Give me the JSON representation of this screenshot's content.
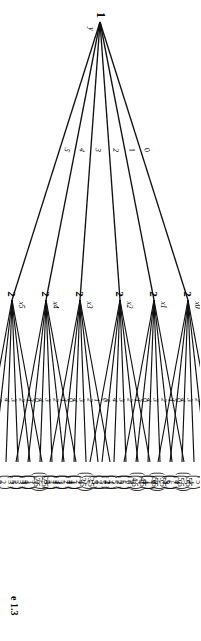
{
  "figure": {
    "caption": "e 1.3",
    "root": {
      "player": "1",
      "name": "y"
    },
    "root_actions": [
      "0",
      "1",
      "2",
      "3",
      "4",
      "5"
    ],
    "subnode_actions": [
      "0",
      "1",
      "2",
      "3",
      "4",
      "5"
    ],
    "nodes": [
      {
        "name": "x0",
        "player": "2",
        "payoffs": [
          [
            "5",
            "6"
          ],
          [
            "5",
            "5"
          ],
          [
            "5",
            "4"
          ],
          [
            "5",
            "3"
          ],
          [
            "7",
            "5"
          ],
          [
            "5.5",
            "5.5"
          ]
        ]
      },
      {
        "name": "x1",
        "player": "2",
        "payoffs": [
          [
            "5.5",
            "5.5"
          ],
          [
            "4",
            "6"
          ],
          [
            "4",
            "5"
          ],
          [
            "4",
            "4"
          ],
          [
            "4",
            "3"
          ],
          [
            "6",
            "5"
          ]
        ]
      },
      {
        "name": "x2",
        "player": "2",
        "payoffs": [
          [
            "6",
            "4"
          ],
          [
            "4.5",
            "4.5"
          ],
          [
            "3",
            "5"
          ],
          [
            "3",
            "4"
          ],
          [
            "3",
            "3"
          ],
          [
            "5",
            "5"
          ]
        ]
      },
      {
        "name": "x3",
        "player": "2",
        "payoffs": [
          [
            "5",
            "4"
          ],
          [
            "5",
            "3"
          ],
          [
            "3.5",
            "3.5"
          ],
          [
            "2",
            "4"
          ],
          [
            "2",
            "3"
          ],
          [
            "4",
            "5"
          ]
        ]
      },
      {
        "name": "x4",
        "player": "2",
        "payoffs": [
          [
            "4",
            "4"
          ],
          [
            "4",
            "3"
          ],
          [
            "4",
            "2"
          ],
          [
            "2.5",
            "2.5"
          ],
          [
            "1",
            "3"
          ],
          [
            "3",
            "5"
          ]
        ]
      },
      {
        "name": "x5",
        "player": "2",
        "payoffs": [
          [
            "3",
            "5"
          ],
          [
            "3",
            "4"
          ],
          [
            "3",
            "3"
          ],
          [
            "3",
            "2"
          ],
          [
            "3",
            "1"
          ],
          [
            "1.5",
            "1.5"
          ]
        ]
      }
    ]
  }
}
